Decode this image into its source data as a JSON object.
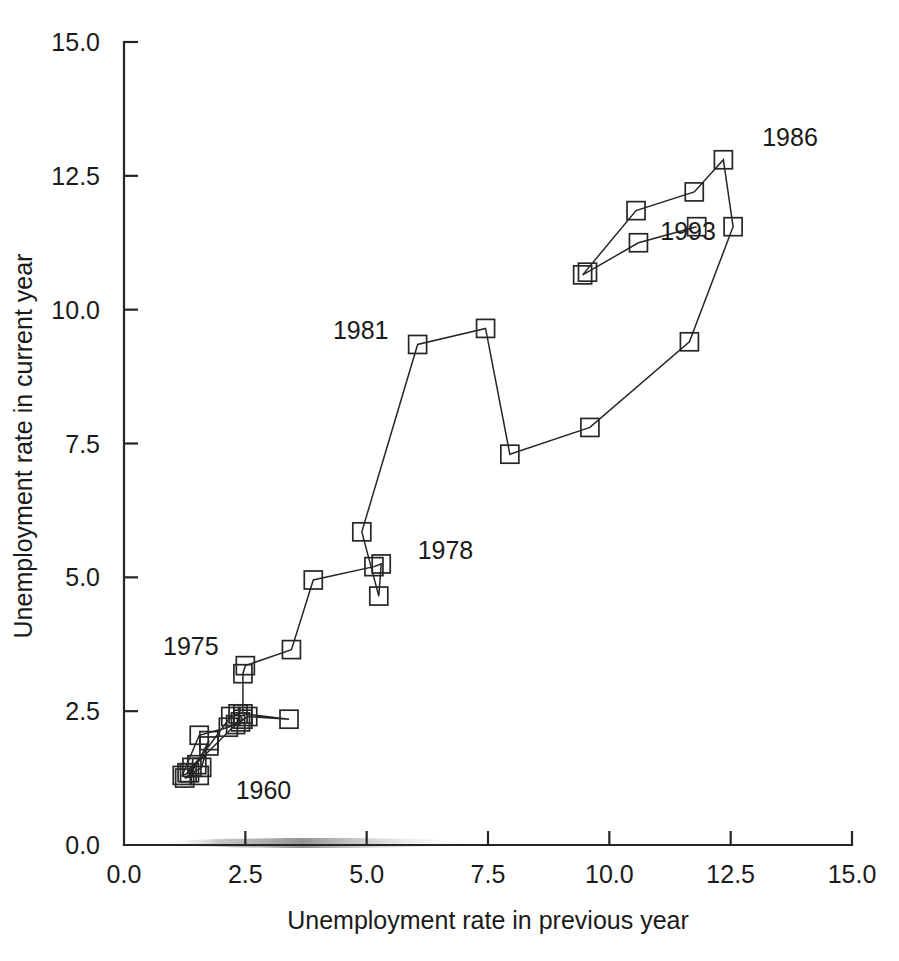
{
  "chart_data": {
    "type": "scatter",
    "title": "",
    "subtitle": "",
    "xlabel": "Unemployment rate in previous year",
    "ylabel": "Unemployment rate in current year",
    "xlim": [
      0.0,
      15.0
    ],
    "ylim": [
      0.0,
      15.0
    ],
    "xticks": [
      "0.0",
      "2.5",
      "5.0",
      "7.5",
      "10.0",
      "12.5",
      "15.0"
    ],
    "yticks": [
      "0.0",
      "2.5",
      "5.0",
      "7.5",
      "10.0",
      "12.5",
      "15.0"
    ],
    "xtick_values": [
      0.0,
      2.5,
      5.0,
      7.5,
      10.0,
      12.5,
      15.0
    ],
    "ytick_values": [
      0.0,
      2.5,
      5.0,
      7.5,
      10.0,
      12.5,
      15.0
    ],
    "grid": false,
    "legend": "none",
    "marker": "open-square",
    "connected": true,
    "series": [
      {
        "name": "Unemployment rate phase path",
        "x": [
          1.55,
          1.25,
          1.6,
          1.75,
          1.5,
          1.35,
          1.2,
          1.55,
          2.15,
          2.45,
          2.35,
          2.2,
          1.75,
          1.4,
          1.3,
          2.3,
          2.4,
          2.55,
          3.4,
          2.45,
          2.45,
          2.5,
          3.45,
          3.9,
          5.15,
          5.3,
          5.25,
          4.9,
          6.05,
          7.45,
          7.95,
          9.6,
          11.65,
          12.55,
          12.35,
          11.75,
          10.55,
          9.45,
          9.55,
          10.6,
          11.8
        ],
        "y": [
          1.3,
          1.25,
          1.45,
          1.95,
          1.5,
          1.35,
          1.3,
          2.05,
          2.2,
          2.35,
          2.45,
          2.4,
          1.85,
          1.45,
          1.35,
          2.25,
          2.3,
          2.4,
          2.35,
          2.45,
          3.2,
          3.35,
          3.65,
          4.95,
          5.2,
          5.25,
          4.65,
          5.85,
          9.35,
          9.65,
          7.3,
          7.8,
          9.4,
          11.55,
          12.8,
          12.2,
          11.85,
          10.65,
          10.7,
          11.25,
          11.55
        ]
      }
    ],
    "annotations": [
      {
        "label": "1960",
        "x": 2.3,
        "y": 0.85,
        "align": "left"
      },
      {
        "label": "1975",
        "x": 1.95,
        "y": 3.55,
        "align": "right"
      },
      {
        "label": "1978",
        "x": 6.05,
        "y": 5.35,
        "align": "left"
      },
      {
        "label": "1981",
        "x": 5.45,
        "y": 9.45,
        "align": "right"
      },
      {
        "label": "1986",
        "x": 13.15,
        "y": 13.05,
        "align": "left"
      },
      {
        "label": "1993",
        "x": 11.05,
        "y": 11.3,
        "align": "left"
      }
    ],
    "colors": {
      "axis": "#262626",
      "line": "#262626",
      "marker": "#262626",
      "background": "#ffffff",
      "text": "#1a1a1a"
    }
  }
}
